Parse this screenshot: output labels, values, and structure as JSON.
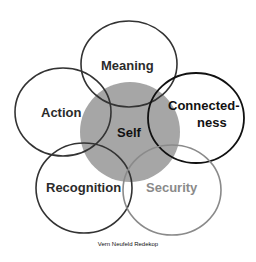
{
  "diagram": {
    "center": {
      "label": "Self",
      "fill": "#a6a6a6"
    },
    "petals": [
      {
        "label": "Meaning",
        "stroke": "#333333"
      },
      {
        "label": "Action",
        "stroke": "#333333"
      },
      {
        "label": "Connected-",
        "label2": "ness",
        "stroke": "#111111"
      },
      {
        "label": "Recognition",
        "stroke": "#333333"
      },
      {
        "label": "Security",
        "stroke": "#8a8a8a"
      }
    ],
    "credit": "Vern Neufeld Redekop"
  }
}
